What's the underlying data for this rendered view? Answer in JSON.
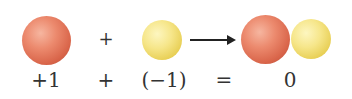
{
  "diagram": {
    "top_row": {
      "sphere1": {
        "color": "red",
        "hex": "#e07a5f"
      },
      "operator1": "+",
      "sphere2": {
        "color": "yellow",
        "hex": "#f3e07a"
      },
      "arrow": "right-arrow",
      "product": [
        {
          "color": "red",
          "hex": "#e07a5f"
        },
        {
          "color": "yellow",
          "hex": "#f3e07a"
        }
      ]
    },
    "bottom_row": {
      "term1": "+1",
      "operator1": "+",
      "term2": "(−1)",
      "operator2": "=",
      "result": "0"
    }
  }
}
